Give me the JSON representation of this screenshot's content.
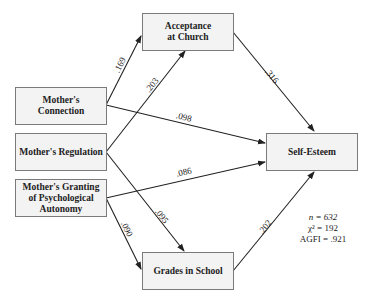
{
  "diagram": {
    "type": "path-model",
    "nodes": [
      {
        "id": "connection",
        "label": "Mother's Connection"
      },
      {
        "id": "regulation",
        "label": "Mother's Regulation"
      },
      {
        "id": "autonomy",
        "label": "Mother's Granting of Psychological Autonomy"
      },
      {
        "id": "church",
        "label": "Acceptance at Church"
      },
      {
        "id": "grades",
        "label": "Grades in School"
      },
      {
        "id": "selfesteem",
        "label": "Self-Esteem"
      }
    ],
    "edges": [
      {
        "from": "connection",
        "to": "church",
        "label": ".169"
      },
      {
        "from": "regulation",
        "to": "church",
        "label": ".203"
      },
      {
        "from": "connection",
        "to": "selfesteem",
        "label": ".098"
      },
      {
        "from": "church",
        "to": "selfesteem",
        "label": ".316"
      },
      {
        "from": "autonomy",
        "to": "selfesteem",
        "label": ".086"
      },
      {
        "from": "regulation",
        "to": "grades",
        "label": ".095"
      },
      {
        "from": "autonomy",
        "to": "grades",
        "label": ".090"
      },
      {
        "from": "grades",
        "to": "selfesteem",
        "label": ".202"
      }
    ],
    "stats": {
      "n": "n = 632",
      "chi": "χ² = 192",
      "agfi": "AGFI = .921"
    }
  },
  "labels": {
    "connection": "Mother's Connection",
    "regulation": "Mother's Regulation",
    "autonomy": "Mother's Granting of Psychological Autonomy",
    "church": "Acceptance at Church",
    "grades": "Grades in School",
    "selfesteem": "Self-Esteem"
  }
}
